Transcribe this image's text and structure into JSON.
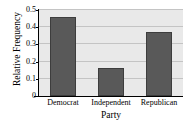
{
  "chart_data": {
    "type": "bar",
    "title": "",
    "subtitle": "",
    "xlabel": "Party",
    "ylabel": "Relative Frequency",
    "categories": [
      "Democrat",
      "Independent",
      "Republican"
    ],
    "values": [
      0.46,
      0.16,
      0.37
    ],
    "series": [
      {
        "name": "Relative Frequency",
        "values": [
          0.46,
          0.16,
          0.37
        ]
      }
    ],
    "ylim": [
      0,
      0.5
    ],
    "y_ticks": [
      0,
      0.1,
      0.2,
      0.3,
      0.4,
      0.5
    ],
    "y_tick_labels": [
      "0",
      "0.1",
      "0.2",
      "0.3",
      "0.4",
      "0.5"
    ],
    "grid": true,
    "grid_axis": "y",
    "legend": false,
    "legend_position": "none",
    "annotations": [],
    "colors": {
      "bar_fill": "#595959",
      "bar_edge": "#3d3d3d",
      "plot_background": "#e9e9e9",
      "figure_background": "#ffffff",
      "gridline": "#c4c4c4",
      "axis": "#000000",
      "text": "#000000"
    }
  }
}
